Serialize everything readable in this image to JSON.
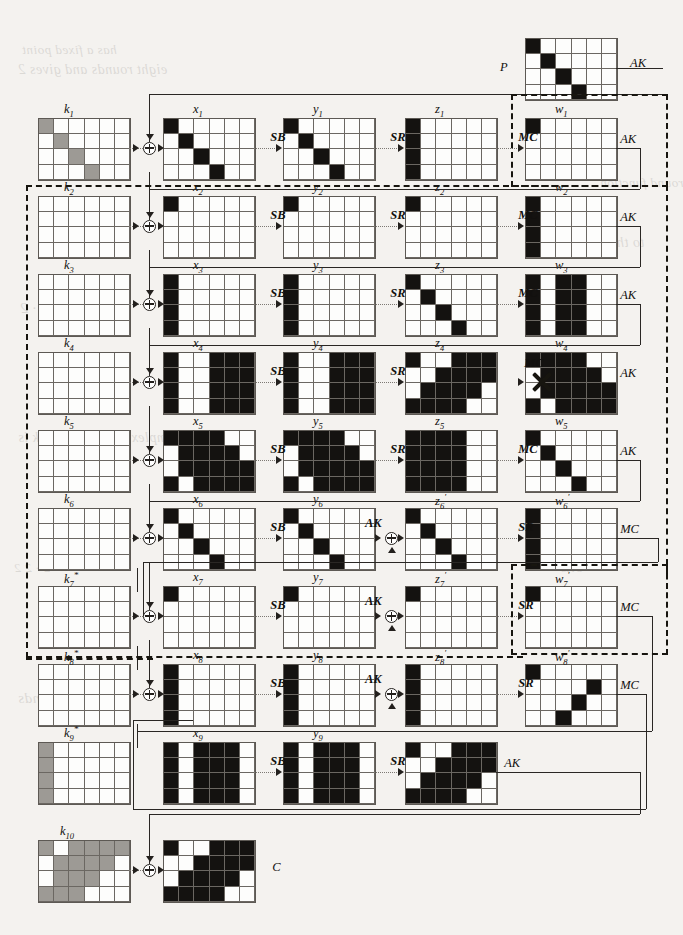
{
  "figure": {
    "type": "aes-differential-characteristic-trail",
    "grid_cols": 6,
    "grid_rows": 4,
    "colors": {
      "active": "#141210",
      "key": "#9d9a95",
      "inactive": "#fdfdfc",
      "line": "#2a2724"
    },
    "legend_ops": {
      "sb": "SB",
      "sr": "SR",
      "mc": "MC",
      "ak": "AK",
      "xor": "xor-circle"
    }
  },
  "labels": {
    "plaintext": "P",
    "ciphertext": "C",
    "ak": "AK",
    "sb": "SB",
    "sr": "SR",
    "mc": "MC",
    "k": [
      "k₁",
      "k₂",
      "k₃",
      "k₄",
      "k₅",
      "k₆",
      "k₇*",
      "k₈*",
      "k₉*",
      "k₁₀"
    ],
    "x": [
      "x₁",
      "x₂",
      "x₃",
      "x₄",
      "x₅",
      "x₆",
      "x₇",
      "x₈",
      "x₉"
    ],
    "y": [
      "y₁",
      "y₂",
      "y₃",
      "y₄",
      "y₅",
      "y₆",
      "y₇",
      "y₈",
      "y₉"
    ],
    "z": [
      "z₁",
      "z₂",
      "z₃",
      "z₄",
      "z₅",
      "z₆'",
      "z₇'",
      "z₈'"
    ],
    "w": [
      "w₁",
      "w₂",
      "w₃",
      "w₄",
      "w₅",
      "w₆'",
      "w₇'",
      "w₈'"
    ],
    "contradiction": "X"
  },
  "grids": {
    "P": [
      [
        1,
        0,
        0,
        0,
        0,
        0
      ],
      [
        0,
        1,
        0,
        0,
        0,
        0
      ],
      [
        0,
        0,
        1,
        0,
        0,
        0
      ],
      [
        0,
        0,
        0,
        1,
        0,
        0
      ]
    ],
    "k1": [
      [
        2,
        0,
        0,
        0,
        0,
        0
      ],
      [
        0,
        2,
        0,
        0,
        0,
        0
      ],
      [
        0,
        0,
        2,
        0,
        0,
        0
      ],
      [
        0,
        0,
        0,
        2,
        0,
        0
      ]
    ],
    "x1": [
      [
        1,
        0,
        0,
        0,
        0,
        0
      ],
      [
        0,
        1,
        0,
        0,
        0,
        0
      ],
      [
        0,
        0,
        1,
        0,
        0,
        0
      ],
      [
        0,
        0,
        0,
        1,
        0,
        0
      ]
    ],
    "y1": [
      [
        1,
        0,
        0,
        0,
        0,
        0
      ],
      [
        0,
        1,
        0,
        0,
        0,
        0
      ],
      [
        0,
        0,
        1,
        0,
        0,
        0
      ],
      [
        0,
        0,
        0,
        1,
        0,
        0
      ]
    ],
    "z1": [
      [
        1,
        0,
        0,
        0,
        0,
        0
      ],
      [
        1,
        0,
        0,
        0,
        0,
        0
      ],
      [
        1,
        0,
        0,
        0,
        0,
        0
      ],
      [
        1,
        0,
        0,
        0,
        0,
        0
      ]
    ],
    "w1": [
      [
        1,
        0,
        0,
        0,
        0,
        0
      ],
      [
        0,
        0,
        0,
        0,
        0,
        0
      ],
      [
        0,
        0,
        0,
        0,
        0,
        0
      ],
      [
        0,
        0,
        0,
        0,
        0,
        0
      ]
    ],
    "k2": [
      [
        0,
        0,
        0,
        0,
        0,
        0
      ],
      [
        0,
        0,
        0,
        0,
        0,
        0
      ],
      [
        0,
        0,
        0,
        0,
        0,
        0
      ],
      [
        0,
        0,
        0,
        0,
        0,
        0
      ]
    ],
    "x2": [
      [
        1,
        0,
        0,
        0,
        0,
        0
      ],
      [
        0,
        0,
        0,
        0,
        0,
        0
      ],
      [
        0,
        0,
        0,
        0,
        0,
        0
      ],
      [
        0,
        0,
        0,
        0,
        0,
        0
      ]
    ],
    "y2": [
      [
        1,
        0,
        0,
        0,
        0,
        0
      ],
      [
        0,
        0,
        0,
        0,
        0,
        0
      ],
      [
        0,
        0,
        0,
        0,
        0,
        0
      ],
      [
        0,
        0,
        0,
        0,
        0,
        0
      ]
    ],
    "z2": [
      [
        1,
        0,
        0,
        0,
        0,
        0
      ],
      [
        0,
        0,
        0,
        0,
        0,
        0
      ],
      [
        0,
        0,
        0,
        0,
        0,
        0
      ],
      [
        0,
        0,
        0,
        0,
        0,
        0
      ]
    ],
    "w2": [
      [
        1,
        0,
        0,
        0,
        0,
        0
      ],
      [
        1,
        0,
        0,
        0,
        0,
        0
      ],
      [
        1,
        0,
        0,
        0,
        0,
        0
      ],
      [
        1,
        0,
        0,
        0,
        0,
        0
      ]
    ],
    "k3": [
      [
        0,
        0,
        0,
        0,
        0,
        0
      ],
      [
        0,
        0,
        0,
        0,
        0,
        0
      ],
      [
        0,
        0,
        0,
        0,
        0,
        0
      ],
      [
        0,
        0,
        0,
        0,
        0,
        0
      ]
    ],
    "x3": [
      [
        1,
        0,
        0,
        0,
        0,
        0
      ],
      [
        1,
        0,
        0,
        0,
        0,
        0
      ],
      [
        1,
        0,
        0,
        0,
        0,
        0
      ],
      [
        1,
        0,
        0,
        0,
        0,
        0
      ]
    ],
    "y3": [
      [
        1,
        0,
        0,
        0,
        0,
        0
      ],
      [
        1,
        0,
        0,
        0,
        0,
        0
      ],
      [
        1,
        0,
        0,
        0,
        0,
        0
      ],
      [
        1,
        0,
        0,
        0,
        0,
        0
      ]
    ],
    "z3": [
      [
        1,
        0,
        0,
        0,
        0,
        0
      ],
      [
        0,
        1,
        0,
        0,
        0,
        0
      ],
      [
        0,
        0,
        1,
        0,
        0,
        0
      ],
      [
        0,
        0,
        0,
        1,
        0,
        0
      ]
    ],
    "w3": [
      [
        1,
        0,
        1,
        1,
        0,
        0
      ],
      [
        1,
        0,
        1,
        1,
        0,
        0
      ],
      [
        1,
        0,
        1,
        1,
        0,
        0
      ],
      [
        1,
        0,
        1,
        1,
        0,
        0
      ]
    ],
    "k4": [
      [
        0,
        0,
        0,
        0,
        0,
        0
      ],
      [
        0,
        0,
        0,
        0,
        0,
        0
      ],
      [
        0,
        0,
        0,
        0,
        0,
        0
      ],
      [
        0,
        0,
        0,
        0,
        0,
        0
      ]
    ],
    "x4": [
      [
        1,
        0,
        0,
        1,
        1,
        1
      ],
      [
        1,
        0,
        0,
        1,
        1,
        1
      ],
      [
        1,
        0,
        0,
        1,
        1,
        1
      ],
      [
        1,
        0,
        0,
        1,
        1,
        1
      ]
    ],
    "y4": [
      [
        1,
        0,
        0,
        1,
        1,
        1
      ],
      [
        1,
        0,
        0,
        1,
        1,
        1
      ],
      [
        1,
        0,
        0,
        1,
        1,
        1
      ],
      [
        1,
        0,
        0,
        1,
        1,
        1
      ]
    ],
    "z4": [
      [
        1,
        0,
        0,
        1,
        1,
        1
      ],
      [
        0,
        0,
        1,
        1,
        1,
        1
      ],
      [
        0,
        1,
        1,
        1,
        1,
        0
      ],
      [
        1,
        1,
        1,
        1,
        0,
        0
      ]
    ],
    "w4": [
      [
        1,
        1,
        1,
        1,
        0,
        0
      ],
      [
        0,
        1,
        1,
        1,
        1,
        0
      ],
      [
        0,
        1,
        1,
        1,
        1,
        1
      ],
      [
        1,
        0,
        1,
        1,
        1,
        1
      ]
    ],
    "k5": [
      [
        0,
        0,
        0,
        0,
        0,
        0
      ],
      [
        0,
        0,
        0,
        0,
        0,
        0
      ],
      [
        0,
        0,
        0,
        0,
        0,
        0
      ],
      [
        0,
        0,
        0,
        0,
        0,
        0
      ]
    ],
    "x5": [
      [
        1,
        1,
        1,
        1,
        0,
        0
      ],
      [
        0,
        1,
        1,
        1,
        1,
        0
      ],
      [
        0,
        1,
        1,
        1,
        1,
        1
      ],
      [
        1,
        0,
        1,
        1,
        1,
        1
      ]
    ],
    "y5": [
      [
        1,
        1,
        1,
        1,
        0,
        0
      ],
      [
        0,
        1,
        1,
        1,
        1,
        0
      ],
      [
        0,
        1,
        1,
        1,
        1,
        1
      ],
      [
        1,
        0,
        1,
        1,
        1,
        1
      ]
    ],
    "z5": [
      [
        1,
        1,
        1,
        1,
        0,
        0
      ],
      [
        1,
        1,
        1,
        1,
        0,
        0
      ],
      [
        1,
        1,
        1,
        1,
        0,
        0
      ],
      [
        1,
        1,
        1,
        1,
        0,
        0
      ]
    ],
    "w5": [
      [
        1,
        0,
        0,
        0,
        0,
        0
      ],
      [
        0,
        1,
        0,
        0,
        0,
        0
      ],
      [
        0,
        0,
        1,
        0,
        0,
        0
      ],
      [
        0,
        0,
        0,
        1,
        0,
        0
      ]
    ],
    "k6": [
      [
        0,
        0,
        0,
        0,
        0,
        0
      ],
      [
        0,
        0,
        0,
        0,
        0,
        0
      ],
      [
        0,
        0,
        0,
        0,
        0,
        0
      ],
      [
        0,
        0,
        0,
        0,
        0,
        0
      ]
    ],
    "x6": [
      [
        1,
        0,
        0,
        0,
        0,
        0
      ],
      [
        0,
        1,
        0,
        0,
        0,
        0
      ],
      [
        0,
        0,
        1,
        0,
        0,
        0
      ],
      [
        0,
        0,
        0,
        1,
        0,
        0
      ]
    ],
    "y6": [
      [
        1,
        0,
        0,
        0,
        0,
        0
      ],
      [
        0,
        1,
        0,
        0,
        0,
        0
      ],
      [
        0,
        0,
        1,
        0,
        0,
        0
      ],
      [
        0,
        0,
        0,
        1,
        0,
        0
      ]
    ],
    "z6": [
      [
        1,
        0,
        0,
        0,
        0,
        0
      ],
      [
        0,
        1,
        0,
        0,
        0,
        0
      ],
      [
        0,
        0,
        1,
        0,
        0,
        0
      ],
      [
        0,
        0,
        0,
        1,
        0,
        0
      ]
    ],
    "w6": [
      [
        1,
        0,
        0,
        0,
        0,
        0
      ],
      [
        1,
        0,
        0,
        0,
        0,
        0
      ],
      [
        1,
        0,
        0,
        0,
        0,
        0
      ],
      [
        1,
        0,
        0,
        0,
        0,
        0
      ]
    ],
    "k7": [
      [
        0,
        0,
        0,
        0,
        0,
        0
      ],
      [
        0,
        0,
        0,
        0,
        0,
        0
      ],
      [
        0,
        0,
        0,
        0,
        0,
        0
      ],
      [
        0,
        0,
        0,
        0,
        0,
        0
      ]
    ],
    "x7": [
      [
        1,
        0,
        0,
        0,
        0,
        0
      ],
      [
        0,
        0,
        0,
        0,
        0,
        0
      ],
      [
        0,
        0,
        0,
        0,
        0,
        0
      ],
      [
        0,
        0,
        0,
        0,
        0,
        0
      ]
    ],
    "y7": [
      [
        1,
        0,
        0,
        0,
        0,
        0
      ],
      [
        0,
        0,
        0,
        0,
        0,
        0
      ],
      [
        0,
        0,
        0,
        0,
        0,
        0
      ],
      [
        0,
        0,
        0,
        0,
        0,
        0
      ]
    ],
    "z7": [
      [
        1,
        0,
        0,
        0,
        0,
        0
      ],
      [
        0,
        0,
        0,
        0,
        0,
        0
      ],
      [
        0,
        0,
        0,
        0,
        0,
        0
      ],
      [
        0,
        0,
        0,
        0,
        0,
        0
      ]
    ],
    "w7": [
      [
        1,
        0,
        0,
        0,
        0,
        0
      ],
      [
        0,
        0,
        0,
        0,
        0,
        0
      ],
      [
        0,
        0,
        0,
        0,
        0,
        0
      ],
      [
        0,
        0,
        0,
        0,
        0,
        0
      ]
    ],
    "k8": [
      [
        0,
        0,
        0,
        0,
        0,
        0
      ],
      [
        0,
        0,
        0,
        0,
        0,
        0
      ],
      [
        0,
        0,
        0,
        0,
        0,
        0
      ],
      [
        0,
        0,
        0,
        0,
        0,
        0
      ]
    ],
    "x8": [
      [
        1,
        0,
        0,
        0,
        0,
        0
      ],
      [
        1,
        0,
        0,
        0,
        0,
        0
      ],
      [
        1,
        0,
        0,
        0,
        0,
        0
      ],
      [
        1,
        0,
        0,
        0,
        0,
        0
      ]
    ],
    "y8": [
      [
        1,
        0,
        0,
        0,
        0,
        0
      ],
      [
        1,
        0,
        0,
        0,
        0,
        0
      ],
      [
        1,
        0,
        0,
        0,
        0,
        0
      ],
      [
        1,
        0,
        0,
        0,
        0,
        0
      ]
    ],
    "z8": [
      [
        1,
        0,
        0,
        0,
        0,
        0
      ],
      [
        1,
        0,
        0,
        0,
        0,
        0
      ],
      [
        1,
        0,
        0,
        0,
        0,
        0
      ],
      [
        1,
        0,
        0,
        0,
        0,
        0
      ]
    ],
    "w8": [
      [
        1,
        0,
        0,
        0,
        0,
        0
      ],
      [
        0,
        0,
        0,
        0,
        1,
        0
      ],
      [
        0,
        0,
        0,
        1,
        0,
        0
      ],
      [
        0,
        0,
        1,
        0,
        0,
        0
      ]
    ],
    "k9": [
      [
        2,
        0,
        0,
        0,
        0,
        0
      ],
      [
        2,
        0,
        0,
        0,
        0,
        0
      ],
      [
        2,
        0,
        0,
        0,
        0,
        0
      ],
      [
        2,
        0,
        0,
        0,
        0,
        0
      ]
    ],
    "x9": [
      [
        1,
        0,
        1,
        1,
        1,
        0
      ],
      [
        1,
        0,
        1,
        1,
        1,
        0
      ],
      [
        1,
        0,
        1,
        1,
        1,
        0
      ],
      [
        1,
        0,
        1,
        1,
        1,
        0
      ]
    ],
    "y9": [
      [
        1,
        0,
        1,
        1,
        1,
        0
      ],
      [
        1,
        0,
        1,
        1,
        1,
        0
      ],
      [
        1,
        0,
        1,
        1,
        1,
        0
      ],
      [
        1,
        0,
        1,
        1,
        1,
        0
      ]
    ],
    "z9": [
      [
        1,
        0,
        0,
        1,
        1,
        1
      ],
      [
        0,
        0,
        1,
        1,
        1,
        1
      ],
      [
        0,
        1,
        1,
        1,
        1,
        0
      ],
      [
        1,
        1,
        1,
        1,
        0,
        0
      ]
    ],
    "k10": [
      [
        2,
        0,
        2,
        2,
        2,
        2
      ],
      [
        0,
        2,
        2,
        2,
        2,
        0
      ],
      [
        0,
        2,
        2,
        2,
        0,
        0
      ],
      [
        2,
        2,
        2,
        0,
        0,
        0
      ]
    ],
    "C": [
      [
        1,
        0,
        0,
        1,
        1,
        1
      ],
      [
        0,
        0,
        1,
        1,
        1,
        1
      ],
      [
        0,
        1,
        1,
        1,
        1,
        0
      ],
      [
        1,
        1,
        1,
        1,
        0,
        0
      ]
    ]
  },
  "bleed_text": [
    "has a fixed point",
    "eight rounds and gives 2",
    "cell",
    "round function",
    "to the number",
    "2 · 2",
    "plaintext",
    "the complexity of this attack is",
    "memory",
    "2 · 2 2",
    "bits",
    "rounds"
  ]
}
